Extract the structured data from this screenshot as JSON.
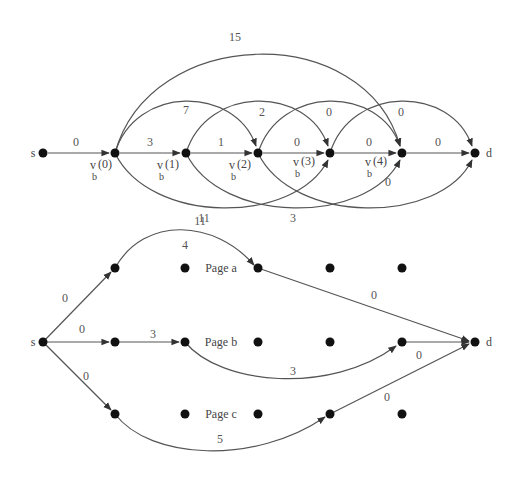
{
  "diagram": {
    "top": {
      "nodes": [
        {
          "id": "s",
          "label": "s",
          "x": 43,
          "y": 153
        },
        {
          "id": "v0",
          "label": "v",
          "sub": "b",
          "idx": "(0)",
          "x": 115,
          "y": 153
        },
        {
          "id": "v1",
          "label": "v",
          "sub": "b",
          "idx": "(1)",
          "x": 186,
          "y": 153
        },
        {
          "id": "v2",
          "label": "v",
          "sub": "b",
          "idx": "(2)",
          "x": 258,
          "y": 153
        },
        {
          "id": "v3",
          "label": "v",
          "sub": "b",
          "idx": "(3)",
          "x": 330,
          "y": 153
        },
        {
          "id": "v4",
          "label": "v",
          "sub": "b",
          "idx": "(4)",
          "x": 402,
          "y": 153
        },
        {
          "id": "d",
          "label": "d",
          "x": 475,
          "y": 153
        }
      ],
      "edges": [
        {
          "from": "s",
          "to": "v0",
          "weight": "0"
        },
        {
          "from": "v0",
          "to": "v1",
          "weight": "3"
        },
        {
          "from": "v1",
          "to": "v2",
          "weight": "1"
        },
        {
          "from": "v2",
          "to": "v3",
          "weight": "0"
        },
        {
          "from": "v3",
          "to": "v4",
          "weight": "0"
        },
        {
          "from": "v4",
          "to": "d",
          "weight": "0"
        },
        {
          "from": "v0",
          "to": "v2",
          "weight": "7"
        },
        {
          "from": "v1",
          "to": "v3",
          "weight": "2"
        },
        {
          "from": "v2",
          "to": "v4",
          "weight": "0"
        },
        {
          "from": "v3",
          "to": "d",
          "weight": "0"
        },
        {
          "from": "v0",
          "to": "v4",
          "weight": "15"
        },
        {
          "from": "v0",
          "to": "v3",
          "weight": "11"
        },
        {
          "from": "v1",
          "to": "v4",
          "weight": "3"
        },
        {
          "from": "v2",
          "to": "d",
          "weight": "0"
        }
      ]
    },
    "bottom": {
      "source_label": "s",
      "sink_label": "d",
      "pages": [
        {
          "label": "Page a"
        },
        {
          "label": "Page b"
        },
        {
          "label": "Page c"
        }
      ],
      "edges": [
        {
          "from": "s",
          "to": "a1",
          "weight": "0"
        },
        {
          "from": "s",
          "to": "b1",
          "weight": "0"
        },
        {
          "from": "s",
          "to": "c1",
          "weight": "0"
        },
        {
          "from": "a1",
          "to": "a3",
          "weight": "11",
          "inner_label": "4"
        },
        {
          "from": "a3",
          "to": "d",
          "weight": "0"
        },
        {
          "from": "b1",
          "to": "b2",
          "weight": "3"
        },
        {
          "from": "b2",
          "to": "b5",
          "weight": "3"
        },
        {
          "from": "b5",
          "to": "d",
          "weight": "0"
        },
        {
          "from": "c1",
          "to": "c4",
          "weight": "5"
        },
        {
          "from": "c4",
          "to": "d",
          "weight": "0"
        }
      ]
    }
  }
}
